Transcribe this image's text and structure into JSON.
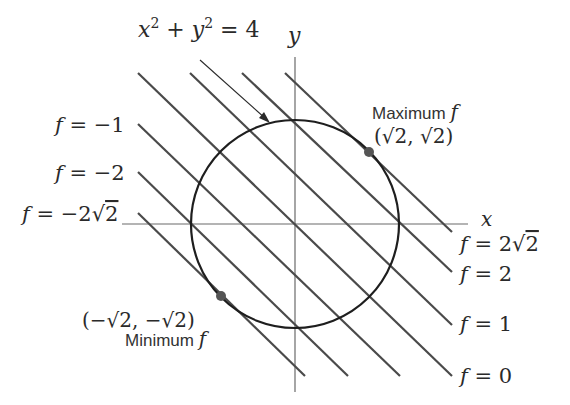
{
  "figure": {
    "constraint_label": {
      "lhs_x": "x",
      "sup1": "2",
      "plus": " + ",
      "lhs_y": "y",
      "sup2": "2",
      "rhs": " = 4"
    },
    "axes": {
      "x_label": "x",
      "y_label": "y"
    },
    "level_lines": [
      {
        "f": "f",
        "eq": " = −2",
        "sqrt": "√",
        "rad": "2",
        "value_text": "f = −2√2",
        "side": "left"
      },
      {
        "f": "f",
        "eq": " = −2",
        "value_text": "f = −2",
        "side": "left"
      },
      {
        "f": "f",
        "eq": " = −1",
        "value_text": "f = −1",
        "side": "left"
      },
      {
        "f": "f",
        "eq": " = 0",
        "value_text": "f = 0",
        "side": "right"
      },
      {
        "f": "f",
        "eq": " = 1",
        "value_text": "f = 1",
        "side": "right"
      },
      {
        "f": "f",
        "eq": " = 2",
        "value_text": "f = 2",
        "side": "right"
      },
      {
        "f": "f",
        "eq": " = 2",
        "sqrt": "√",
        "rad": "2",
        "value_text": "f = 2√2",
        "side": "right"
      }
    ],
    "maximum": {
      "label": "Maximum ",
      "f": "f",
      "point_text": "(√2, √2)"
    },
    "minimum": {
      "label": "Minimum ",
      "f": "f",
      "point_text": "(−√2, −√2)"
    },
    "colors": {
      "lines": "#4a4a4a",
      "circle": "#1e1e1e",
      "points": "#555555",
      "axes": "#6a6a6a"
    }
  }
}
